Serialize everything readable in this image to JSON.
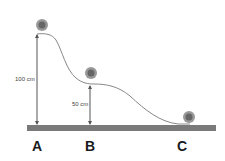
{
  "diagram": {
    "heights": {
      "A": "100 cm",
      "B": "50 cm"
    },
    "points": [
      {
        "id": "A",
        "label": "A"
      },
      {
        "id": "B",
        "label": "B"
      },
      {
        "id": "C",
        "label": "C"
      }
    ],
    "colors": {
      "ground": "#7a7a7a",
      "track": "#888888",
      "arrow": "#555555",
      "ball": "#8a8a8a"
    }
  }
}
